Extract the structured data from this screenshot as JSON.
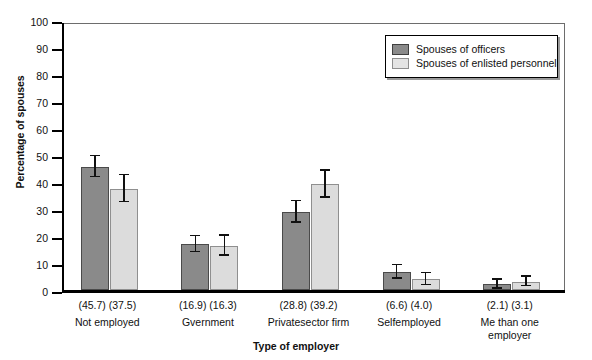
{
  "chart_data": {
    "type": "bar",
    "title": "",
    "xlabel": "Type of employer",
    "ylabel": "Percentage of spouses",
    "ylim": [
      0,
      100
    ],
    "yticks": [
      0,
      10,
      20,
      30,
      40,
      50,
      60,
      70,
      80,
      90,
      100
    ],
    "grid": false,
    "legend_position": "top-right",
    "categories": [
      "Not employed",
      "Gvernment",
      "Privatesector firm",
      "Selfemployed",
      "Me than one\nemployer"
    ],
    "category_lines": [
      [
        "Not employed"
      ],
      [
        "Gvernment"
      ],
      [
        "Privatesector firm"
      ],
      [
        "Selfemployed"
      ],
      [
        "Me than one",
        "employer"
      ]
    ],
    "value_labels": [
      "(45.7) (37.5)",
      "(16.9) (16.3)",
      "(28.8) (39.2)",
      "(6.6)   (4.0)",
      "(2.1)   (3.1)"
    ],
    "series": [
      {
        "name": "Spouses of officers",
        "color": "#8a8a8a",
        "values": [
          45.7,
          16.9,
          28.8,
          6.6,
          2.1
        ],
        "errors": [
          3.9,
          3.0,
          4.0,
          2.5,
          1.6
        ]
      },
      {
        "name": "Spouses of enlisted personnel",
        "color": "#dcdcdc",
        "values": [
          37.5,
          16.3,
          39.2,
          4.0,
          3.1
        ],
        "errors": [
          5.0,
          3.7,
          5.0,
          2.2,
          1.7
        ]
      }
    ]
  },
  "legend": {
    "items": [
      {
        "label": "Spouses of officers",
        "swatch": "dark"
      },
      {
        "label": "Spouses of enlisted personnel",
        "swatch": "light"
      }
    ]
  },
  "axes": {
    "y_title": "Percentage of spouses",
    "x_title": "Type of employer",
    "y_tick_labels": [
      "100",
      "90",
      "80",
      "70",
      "60",
      "50",
      "40",
      "30",
      "20",
      "10",
      "0"
    ]
  }
}
